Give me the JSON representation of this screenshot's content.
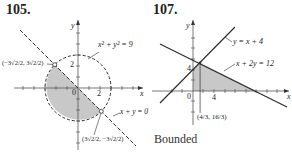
{
  "problems": [
    {
      "number": "105.",
      "equations": {
        "circle": "x² + y² = 9",
        "line": "x + y = 0"
      },
      "points": [
        {
          "label": "(−3√2/2, 3√2/2)",
          "x_num": "−3√2",
          "x_den": "2",
          "y_num": "3√2",
          "y_den": "2"
        },
        {
          "label": "(3√2/2, −3√2/2)",
          "x_num": "3√2",
          "x_den": "2",
          "y_num": "−3√2",
          "y_den": "2"
        }
      ],
      "axis": {
        "x": "x",
        "y": "y",
        "origin": "0",
        "tick_x": "2",
        "tick_y": "2"
      }
    },
    {
      "number": "107.",
      "equations": {
        "line1": "y = x + 4",
        "line2": "x + 2y = 12"
      },
      "points": [
        {
          "label": "(4/3, 16/3)",
          "x_num": "4",
          "x_den": "3",
          "y_num": "16",
          "y_den": "3"
        }
      ],
      "axis": {
        "x": "x",
        "y": "y",
        "origin": "0",
        "tick_x": "4",
        "tick_y": "4"
      },
      "caption": "Bounded"
    }
  ],
  "colors": {
    "shade": "#c8c8c8",
    "line": "#2a2a2a"
  }
}
